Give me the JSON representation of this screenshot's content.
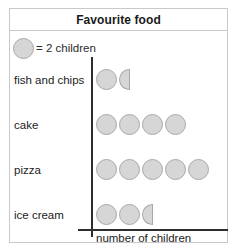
{
  "chart_data": {
    "type": "bar",
    "subtype": "pictogram",
    "title": "Favourite food",
    "xlabel": "number of children",
    "ylabel": "",
    "grid": false,
    "legend_position": "top-left",
    "key": {
      "symbol": "circle-icon",
      "text": "= 2 children",
      "unit_value": 2
    },
    "categories": [
      "fish and chips",
      "cake",
      "pizza",
      "ice cream"
    ],
    "values": [
      3,
      8,
      10,
      5
    ],
    "symbols": [
      {
        "full": 1,
        "half": 1
      },
      {
        "full": 4,
        "half": 0
      },
      {
        "full": 5,
        "half": 0
      },
      {
        "full": 2,
        "half": 1
      }
    ],
    "rows": [
      {
        "label": "fish and chips",
        "value": 3,
        "full": 1,
        "half": 1
      },
      {
        "label": "cake",
        "value": 8,
        "full": 4,
        "half": 0
      },
      {
        "label": "pizza",
        "value": 10,
        "full": 5,
        "half": 0
      },
      {
        "label": "ice cream",
        "value": 5,
        "full": 2,
        "half": 1
      }
    ],
    "colors": {
      "symbol_fill": "#d6d6d6",
      "symbol_stroke": "#a8a8a8",
      "axis": "#2e2e2e",
      "frame": "#c9c9c9",
      "text": "#222222",
      "background": "#ffffff"
    }
  }
}
